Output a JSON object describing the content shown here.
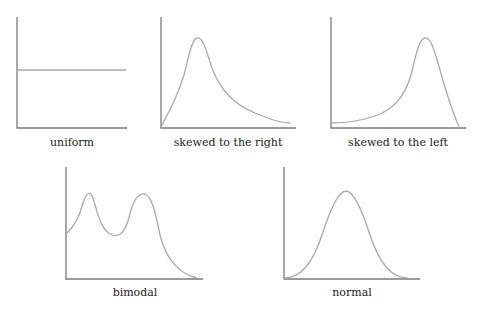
{
  "colors": {
    "axis": "#7a7a7a",
    "curve": "#a9a9a9",
    "label": "#222222"
  },
  "panels": [
    {
      "id": "uniform",
      "label": "uniform"
    },
    {
      "id": "skewed-right",
      "label": "skewed to the right"
    },
    {
      "id": "skewed-left",
      "label": "skewed to the left"
    },
    {
      "id": "bimodal",
      "label": "bimodal"
    },
    {
      "id": "normal",
      "label": "normal"
    }
  ]
}
